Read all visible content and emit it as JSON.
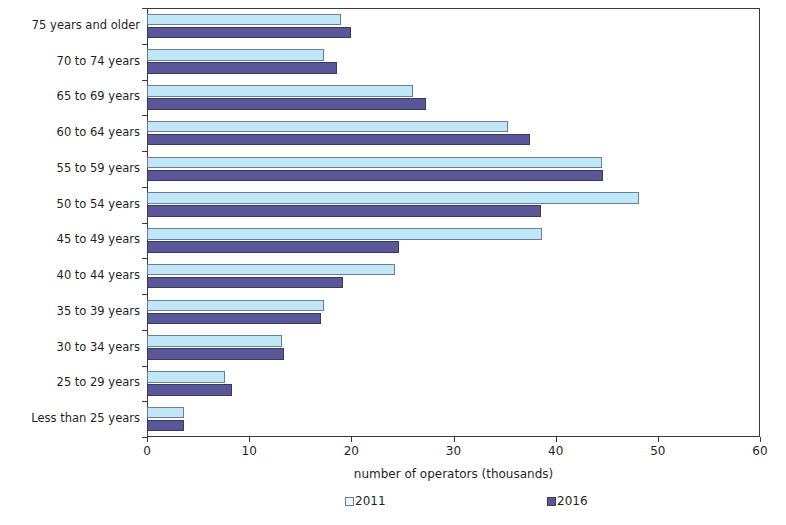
{
  "chart_data": {
    "type": "bar",
    "orientation": "horizontal",
    "title": "",
    "xlabel": "number of operators (thousands)",
    "ylabel": "",
    "xlim": [
      0,
      60
    ],
    "xticks": [
      0,
      10,
      20,
      30,
      40,
      50,
      60
    ],
    "grid": false,
    "legend_position": "bottom",
    "categories": [
      "75 years and older",
      "70 to 74 years",
      "65 to 69 years",
      "60 to 64 years",
      "55 to 59 years",
      "50 to 54 years",
      "45 to 49 years",
      "40 to 44 years",
      "35 to 39 years",
      "30 to 34 years",
      "25 to 29 years",
      "Less than 25 years"
    ],
    "series": [
      {
        "name": "2011",
        "color": "#bfe7f5",
        "values": [
          19.0,
          17.3,
          26.0,
          35.3,
          44.5,
          48.2,
          38.7,
          24.3,
          17.3,
          13.2,
          7.6,
          3.6
        ]
      },
      {
        "name": "2016",
        "color": "#5a5799",
        "values": [
          20.0,
          18.6,
          27.3,
          37.5,
          44.6,
          38.6,
          24.7,
          19.2,
          17.0,
          13.4,
          8.3,
          3.6
        ]
      }
    ]
  },
  "legend": {
    "items": [
      {
        "label": "2011",
        "swatch": "light-blue-square"
      },
      {
        "label": "2016",
        "swatch": "dark-purple-square"
      }
    ]
  },
  "axis": {
    "x_title": "number of operators (thousands)",
    "x_tick_labels": [
      "0",
      "10",
      "20",
      "30",
      "40",
      "50",
      "60"
    ]
  }
}
